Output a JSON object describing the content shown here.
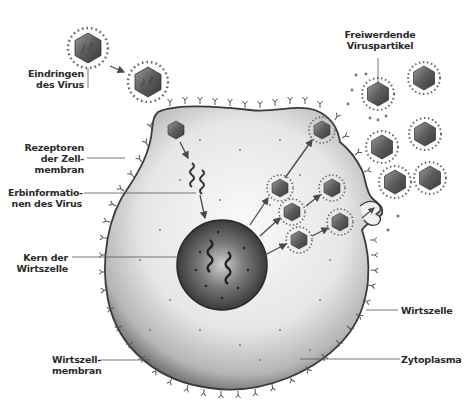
{
  "diagram": {
    "colors": {
      "background": "#ffffff",
      "cytoplasm_light": "#f2f2f2",
      "cytoplasm_dark": "#8a8a8a",
      "membrane_edge": "#3a3a3a",
      "nucleus": "#4a4a4a",
      "virus": "#5a5a5a",
      "label_text": "#2a2a2a",
      "leader_line": "#555555"
    },
    "labels": {
      "entry": [
        "Eindringen",
        "des Virus"
      ],
      "released": [
        "Freiwerdende",
        "Viruspartikel"
      ],
      "receptors": [
        "Rezeptoren",
        "der Zell-",
        "membran"
      ],
      "genetic_info": [
        "Erbinformatio-",
        "nen des Virus"
      ],
      "nucleus": [
        "Kern der",
        "Wirtszelle"
      ],
      "host_cell": [
        "Wirtszelle"
      ],
      "host_membrane": [
        "Wirtszell-",
        "membran"
      ],
      "cytoplasm": [
        "Zytoplasma"
      ]
    }
  }
}
